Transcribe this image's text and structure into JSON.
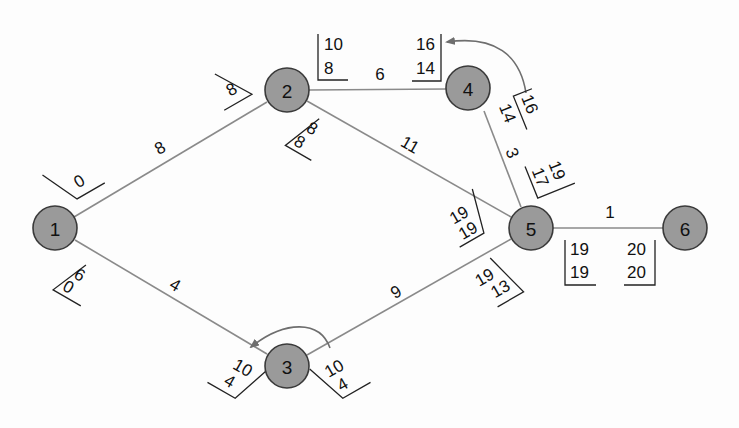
{
  "diagram": {
    "type": "network-schedule (activity-on-arrow, CPM)",
    "colors": {
      "node_fill": "#9a9a9a",
      "node_stroke": "#3a3a3a",
      "edge": "#8a8a8a",
      "text": "#111111"
    },
    "nodes": [
      {
        "id": "1",
        "label": "1"
      },
      {
        "id": "2",
        "label": "2"
      },
      {
        "id": "3",
        "label": "3"
      },
      {
        "id": "4",
        "label": "4"
      },
      {
        "id": "5",
        "label": "5"
      },
      {
        "id": "6",
        "label": "6"
      }
    ],
    "edges": [
      {
        "from": "1",
        "to": "2",
        "duration": "8",
        "start_box": [
          "0"
        ],
        "end_box": [
          "8"
        ]
      },
      {
        "from": "1",
        "to": "3",
        "duration": "4",
        "start_box": [
          "6",
          "0"
        ],
        "end_box": [
          "10",
          "4"
        ]
      },
      {
        "from": "2",
        "to": "4",
        "duration": "6",
        "start_box": [
          "10",
          "8"
        ],
        "end_box": [
          "16",
          "14"
        ]
      },
      {
        "from": "2",
        "to": "5",
        "duration": "11",
        "start_box": [
          "8",
          "8"
        ],
        "end_box": [
          "19",
          "19"
        ]
      },
      {
        "from": "3",
        "to": "5",
        "duration": "9",
        "start_box": [
          "10",
          "4"
        ],
        "end_box": [
          "19",
          "13"
        ]
      },
      {
        "from": "4",
        "to": "5",
        "duration": "3",
        "start_box": [
          "16",
          "14"
        ],
        "end_box": [
          "19",
          "17"
        ]
      },
      {
        "from": "5",
        "to": "6",
        "duration": "1",
        "start_box": [
          "19",
          "19"
        ],
        "end_box": [
          "20",
          "20"
        ]
      }
    ],
    "feedback_arrows": [
      {
        "at_node": "4",
        "from_box": "4-5 start (16/14)",
        "to_box": "2-4 end (16/14)"
      },
      {
        "at_node": "3",
        "from_box": "3-5 start (10/4)",
        "to_box": "1-3 end (10/4)"
      }
    ]
  },
  "labels": {
    "n1": "1",
    "n2": "2",
    "n3": "3",
    "n4": "4",
    "n5": "5",
    "n6": "6",
    "e12_dur": "8",
    "e12_s1": "0",
    "e12_e1": "8",
    "e13_dur": "4",
    "e13_s1": "6",
    "e13_s2": "0",
    "e13_e1": "10",
    "e13_e2": "4",
    "e24_dur": "6",
    "e24_s1": "10",
    "e24_s2": "8",
    "e24_e1": "16",
    "e24_e2": "14",
    "e25_dur": "11",
    "e25_s1": "8",
    "e25_s2": "8",
    "e25_e1": "19",
    "e25_e2": "19",
    "e35_dur": "9",
    "e35_s1": "10",
    "e35_s2": "4",
    "e35_e1": "19",
    "e35_e2": "13",
    "e45_dur": "3",
    "e45_s1": "16",
    "e45_s2": "14",
    "e45_e1": "19",
    "e45_e2": "17",
    "e56_dur": "1",
    "e56_s1": "19",
    "e56_s2": "19",
    "e56_e1": "20",
    "e56_e2": "20"
  }
}
